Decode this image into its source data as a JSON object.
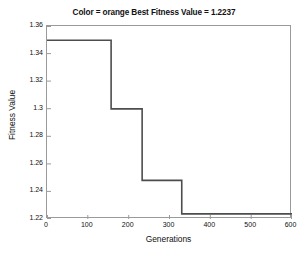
{
  "chart_data": {
    "type": "line",
    "title": "Color = orange Best Fitness Value = 1.2237",
    "xlabel": "Generations",
    "ylabel": "Fitness Value",
    "xlim": [
      0,
      600
    ],
    "ylim": [
      1.22,
      1.36
    ],
    "xticks": [
      0,
      100,
      200,
      300,
      400,
      500,
      600
    ],
    "xtick_labels": [
      "0",
      "100",
      "200",
      "300",
      "400",
      "500",
      "600"
    ],
    "yticks": [
      1.22,
      1.24,
      1.26,
      1.28,
      1.3,
      1.32,
      1.34,
      1.36
    ],
    "ytick_labels": [
      "1.22",
      "1.24",
      "1.26",
      "1.28",
      "1.3",
      "1.32",
      "1.34",
      "1.36"
    ],
    "grid": false,
    "legend": null,
    "line_color": "#4d4d4d",
    "line_width": 1.6,
    "drawstyle": "steps-post",
    "series": [
      {
        "name": "Best Fitness Value",
        "x": [
          0,
          157,
          157,
          233,
          233,
          330,
          330,
          600
        ],
        "y": [
          1.3497,
          1.3497,
          1.2999,
          1.2999,
          1.248,
          1.248,
          1.2237,
          1.2237
        ]
      }
    ],
    "steps": [
      {
        "from_generation": 0,
        "to_generation": 157,
        "fitness": 1.3497
      },
      {
        "from_generation": 157,
        "to_generation": 233,
        "fitness": 1.2999
      },
      {
        "from_generation": 233,
        "to_generation": 330,
        "fitness": 1.248
      },
      {
        "from_generation": 330,
        "to_generation": 600,
        "fitness": 1.2237
      }
    ],
    "best_fitness_value": 1.2237,
    "color_label": "orange"
  }
}
